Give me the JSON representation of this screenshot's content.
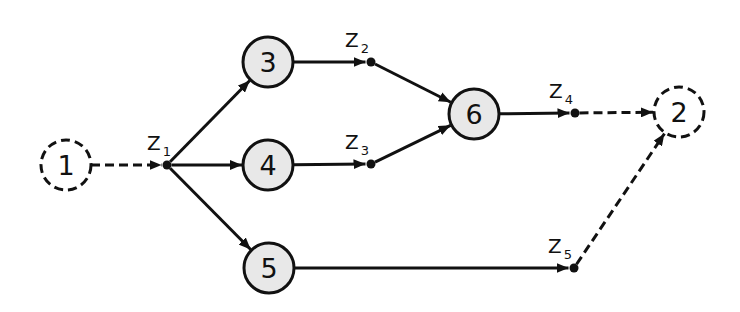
{
  "diagram": {
    "type": "network-graph",
    "colors": {
      "background": "#ffffff",
      "stroke": "#111111",
      "node_fill": "#e8e8e8",
      "dummy_node_fill": "#ffffff"
    },
    "nodes": [
      {
        "id": "1",
        "label": "1",
        "x": 66,
        "y": 165,
        "style": "dashed"
      },
      {
        "id": "3",
        "label": "3",
        "x": 268,
        "y": 62,
        "style": "solid"
      },
      {
        "id": "4",
        "label": "4",
        "x": 268,
        "y": 165,
        "style": "solid"
      },
      {
        "id": "5",
        "label": "5",
        "x": 269,
        "y": 268,
        "style": "solid"
      },
      {
        "id": "6",
        "label": "6",
        "x": 474,
        "y": 114,
        "style": "solid"
      },
      {
        "id": "2",
        "label": "2",
        "x": 679,
        "y": 112,
        "style": "dashed"
      }
    ],
    "junctions": [
      {
        "id": "Z1",
        "letter": "Z",
        "sub": "1",
        "x": 167,
        "y": 165,
        "lx": 147,
        "ly": 150
      },
      {
        "id": "Z2",
        "letter": "Z",
        "sub": "2",
        "x": 371,
        "y": 62,
        "lx": 345,
        "ly": 47
      },
      {
        "id": "Z3",
        "letter": "Z",
        "sub": "3",
        "x": 371,
        "y": 164,
        "lx": 345,
        "ly": 149
      },
      {
        "id": "Z4",
        "letter": "Z",
        "sub": "4",
        "x": 575,
        "y": 113,
        "lx": 549,
        "ly": 98
      },
      {
        "id": "Z5",
        "letter": "Z",
        "sub": "5",
        "x": 574,
        "y": 268,
        "lx": 548,
        "ly": 253
      }
    ],
    "edges": [
      {
        "from": "1",
        "to": "Z1",
        "style": "dashed"
      },
      {
        "from": "Z1",
        "to": "3",
        "style": "solid"
      },
      {
        "from": "Z1",
        "to": "4",
        "style": "solid"
      },
      {
        "from": "Z1",
        "to": "5",
        "style": "solid"
      },
      {
        "from": "3",
        "to": "Z2",
        "style": "solid"
      },
      {
        "from": "4",
        "to": "Z3",
        "style": "solid"
      },
      {
        "from": "Z2",
        "to": "6",
        "style": "solid"
      },
      {
        "from": "Z3",
        "to": "6",
        "style": "solid"
      },
      {
        "from": "6",
        "to": "Z4",
        "style": "solid"
      },
      {
        "from": "5",
        "to": "Z5",
        "style": "solid"
      },
      {
        "from": "Z4",
        "to": "2",
        "style": "dashed"
      },
      {
        "from": "Z5",
        "to": "2",
        "style": "dashed"
      }
    ]
  }
}
